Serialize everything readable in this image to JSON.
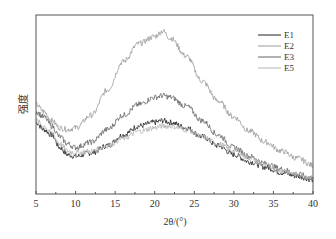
{
  "chart_data": {
    "type": "line",
    "title": "",
    "xlabel": "2θ/(°)",
    "ylabel": "强度",
    "xlim": [
      5,
      40
    ],
    "ylim": [
      0,
      100
    ],
    "xticks": [
      5,
      10,
      15,
      20,
      25,
      30,
      35,
      40
    ],
    "yticks": [],
    "grid": false,
    "legend": "top-right",
    "series": [
      {
        "name": "E1",
        "color": "#222222",
        "x": [
          5,
          6,
          7,
          8,
          9,
          10,
          12,
          14,
          16,
          18,
          20,
          21,
          22,
          24,
          26,
          28,
          30,
          32,
          34,
          36,
          38,
          40
        ],
        "y": [
          40,
          36,
          33,
          26,
          22,
          21,
          23,
          27,
          33,
          38,
          40,
          41,
          40,
          37,
          32,
          27,
          22,
          18,
          15,
          12,
          10,
          8
        ]
      },
      {
        "name": "E2",
        "color": "#9a9a9a",
        "x": [
          5,
          6,
          7,
          8,
          9,
          10,
          12,
          14,
          16,
          18,
          20,
          21,
          22,
          24,
          26,
          28,
          30,
          32,
          34,
          36,
          38,
          40
        ],
        "y": [
          50,
          46,
          41,
          37,
          36,
          37,
          44,
          58,
          74,
          84,
          88,
          91,
          87,
          77,
          63,
          52,
          43,
          35,
          29,
          24,
          20,
          16
        ]
      },
      {
        "name": "E3",
        "color": "#666666",
        "x": [
          5,
          6,
          7,
          8,
          9,
          10,
          12,
          14,
          16,
          18,
          20,
          21,
          22,
          24,
          26,
          28,
          30,
          32,
          34,
          36,
          38,
          40
        ],
        "y": [
          46,
          43,
          38,
          32,
          28,
          26,
          29,
          36,
          44,
          50,
          54,
          55,
          54,
          49,
          41,
          33,
          26,
          21,
          17,
          14,
          11,
          9
        ]
      },
      {
        "name": "E5",
        "color": "#b5b5b5",
        "x": [
          5,
          6,
          7,
          8,
          9,
          10,
          12,
          14,
          16,
          18,
          20,
          21,
          22,
          24,
          26,
          28,
          30,
          32,
          34,
          36,
          38,
          40
        ],
        "y": [
          41,
          38,
          34,
          28,
          24,
          23,
          24,
          27,
          31,
          35,
          37,
          38,
          38,
          36,
          32,
          28,
          24,
          20,
          16,
          13,
          11,
          9
        ]
      }
    ]
  }
}
